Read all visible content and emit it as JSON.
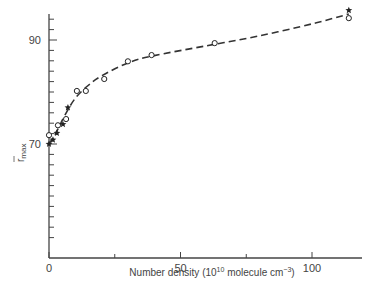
{
  "chart_data": {
    "type": "scatter",
    "title": "",
    "xlabel": "Number density (10^10 molecule cm^-3)",
    "xlabel_parts": {
      "prefix": "Number density (10",
      "sup1": "10",
      "middle": " molecule cm",
      "sup2": "−3",
      "suffix": ")"
    },
    "ylabel": "r̄max",
    "ylabel_parts": {
      "main": "r",
      "sub": "max"
    },
    "xlim": [
      0,
      120
    ],
    "ylim": [
      50,
      96
    ],
    "x_ticks": [
      0,
      50,
      100
    ],
    "x_tick_labels": [
      "0",
      "50",
      "100"
    ],
    "x_minor_ticks": [
      25,
      75
    ],
    "y_ticks": [
      70,
      90
    ],
    "y_tick_labels": [
      "70",
      "90"
    ],
    "y_minor_ticks": [
      52,
      54,
      56,
      58,
      60,
      62,
      64,
      66,
      68,
      72,
      74,
      76,
      78,
      80,
      82,
      84,
      86,
      88,
      92,
      94
    ],
    "grid": false,
    "legend": null,
    "series": [
      {
        "name": "open circles",
        "marker": "circle-open",
        "points": [
          {
            "x": 0,
            "y": 71.7
          },
          {
            "x": 3.4,
            "y": 73.6
          },
          {
            "x": 6.5,
            "y": 74.8
          },
          {
            "x": 10.6,
            "y": 80.2
          },
          {
            "x": 14,
            "y": 80.2
          },
          {
            "x": 21,
            "y": 82.5
          },
          {
            "x": 30,
            "y": 85.9
          },
          {
            "x": 39,
            "y": 87.1
          },
          {
            "x": 63,
            "y": 89.4
          },
          {
            "x": 114,
            "y": 94.2
          }
        ]
      },
      {
        "name": "filled stars",
        "marker": "star-filled",
        "points": [
          {
            "x": 0,
            "y": 70
          },
          {
            "x": 1.5,
            "y": 70.8
          },
          {
            "x": 3,
            "y": 72.1
          },
          {
            "x": 5.3,
            "y": 73.8
          },
          {
            "x": 7.2,
            "y": 77
          },
          {
            "x": 114,
            "y": 95.7
          }
        ]
      },
      {
        "name": "fit curve",
        "marker": "dashed-line",
        "points": [
          {
            "x": 0,
            "y": 70
          },
          {
            "x": 3,
            "y": 72.5
          },
          {
            "x": 6,
            "y": 75.5
          },
          {
            "x": 10,
            "y": 78.8
          },
          {
            "x": 15,
            "y": 81.3
          },
          {
            "x": 20,
            "y": 83.1
          },
          {
            "x": 30,
            "y": 85.6
          },
          {
            "x": 40,
            "y": 87
          },
          {
            "x": 60,
            "y": 88.9
          },
          {
            "x": 80,
            "y": 90.8
          },
          {
            "x": 100,
            "y": 93.1
          },
          {
            "x": 114,
            "y": 95
          }
        ]
      }
    ]
  },
  "layout": {
    "origin_px": {
      "x": 49,
      "y": 258
    },
    "x_px_per_unit": 2.63,
    "y_ref": {
      "value": 70,
      "px": 144
    },
    "y_px_per_unit": 5.2,
    "y_axis_top_px": 14,
    "x_axis_right_px": 362,
    "colors": {
      "axis": "#444444",
      "marker": "#222222",
      "line": "#333333"
    }
  }
}
